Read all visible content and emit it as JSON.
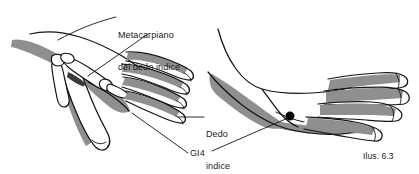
{
  "figure": {
    "title": "Ilus. 6.3",
    "caption": "Ilus. 6.3",
    "background_color": "#ffffff",
    "outline_color": "#141414",
    "shade_color": "#8f8f8f",
    "point_color": "#000000"
  },
  "labels": {
    "metacarpal": {
      "line1": "Metacarpiano",
      "line2": "del dedo indice"
    },
    "index_finger": {
      "line1": "Dedo",
      "line2": "indice"
    },
    "acupoint": "GI4"
  },
  "illustrations": {
    "left_hand": {
      "name": "left-hand-skeletal-view",
      "description": "Dorsal view of hand with first and second metacarpal bones exposed"
    },
    "right_hand": {
      "name": "right-hand-point-location",
      "description": "Lateral view of hand with acupuncture point marked between thumb and index finger"
    }
  },
  "markers": {
    "acupoint_dot": {
      "name": "gi4-point-dot",
      "x": 290,
      "y": 116,
      "radius": 4.2
    }
  }
}
